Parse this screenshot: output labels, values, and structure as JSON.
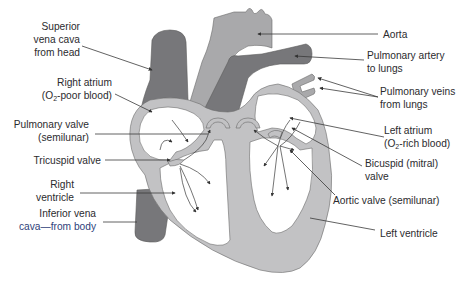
{
  "diagram": {
    "labels": {
      "superior_vena_cava": [
        "Superior",
        "vena cava",
        "from head"
      ],
      "right_atrium": [
        "Right atrium",
        "(O",
        "2",
        "-poor blood)"
      ],
      "pulmonary_valve": [
        "Pulmonary valve",
        "(semilunar)"
      ],
      "tricuspid_valve": "Tricuspid valve",
      "right_ventricle": [
        "Right",
        "ventricle"
      ],
      "inferior_vena_cava": [
        "Inferior vena",
        "cava—from body"
      ],
      "aorta": "Aorta",
      "pulmonary_artery": [
        "Pulmonary artery",
        "to lungs"
      ],
      "pulmonary_veins": [
        "Pulmonary veins",
        "from lungs"
      ],
      "left_atrium": [
        "Left atrium",
        "(O",
        "2",
        "-rich blood)"
      ],
      "bicuspid_valve": [
        "Bicuspid (mitral)",
        "valve"
      ],
      "aortic_valve": "Aortic valve (semilunar)",
      "left_ventricle": "Left ventricle"
    },
    "colors": {
      "wall": "#c2c2c4",
      "vessel_dark": "#77777a",
      "aorta": "#a9a9ab",
      "text": "#2b2b2e"
    }
  }
}
